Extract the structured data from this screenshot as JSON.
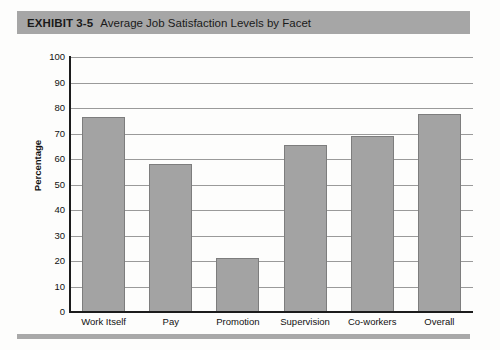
{
  "exhibit": {
    "label": "EXHIBIT 3-5",
    "title": "Average Job Satisfaction Levels by Facet",
    "band_color": "#a6a6a6"
  },
  "chart_data": {
    "type": "bar",
    "title": "Average Job Satisfaction Levels by Facet",
    "xlabel": "",
    "ylabel": "Percentage",
    "categories": [
      "Work Itself",
      "Pay",
      "Promotion",
      "Supervision",
      "Co-workers",
      "Overall"
    ],
    "values": [
      76.5,
      58,
      21,
      65.5,
      69,
      77.5
    ],
    "ylim": [
      0,
      100
    ],
    "yticks": [
      0,
      10,
      20,
      30,
      40,
      50,
      60,
      70,
      80,
      90,
      100
    ],
    "ytick_labels": [
      "0",
      "10",
      "20",
      "30",
      "40",
      "50",
      "60",
      "70",
      "80",
      "90",
      "100"
    ],
    "grid": true,
    "legend": false,
    "bar_color": "#a3a3a3",
    "bar_border_color": "#7d7d7d",
    "gridline_color": "#9a9a9a",
    "axis_color": "#1c1c1c"
  }
}
